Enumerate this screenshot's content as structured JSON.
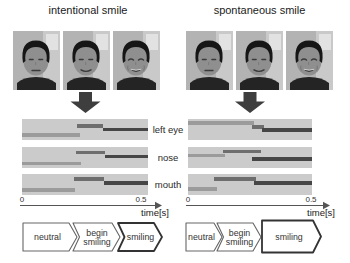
{
  "figure": {
    "feature_labels": [
      "left eye",
      "nose",
      "mouth"
    ],
    "colors": {
      "panel_bg": "#cbcbcb",
      "neutral_bar": "#9b9b9b",
      "begin_bar": "#6e6e6e",
      "smiling_bar": "#464646",
      "arrow": "#3e3e3e",
      "shape_stroke": "#666666",
      "shape_stroke_bold": "#333333",
      "axis": "#555555"
    },
    "groups": [
      {
        "id": "intentional",
        "title": "intentional smile",
        "photos": [
          {
            "expression": "neutral"
          },
          {
            "expression": "slight smile"
          },
          {
            "expression": "big smile"
          }
        ],
        "timeline_rows": [
          {
            "feature": "left eye",
            "bars": [
              {
                "state": "neutral",
                "start_s": 0,
                "end_s": 0.23,
                "top": 14
              },
              {
                "state": "begin smiling",
                "start_s": 0.22,
                "end_s": 0.32,
                "top": 5
              },
              {
                "state": "smiling",
                "start_s": 0.32,
                "end_s": 0.5,
                "top": 8.5
              }
            ]
          },
          {
            "feature": "nose",
            "bars": [
              {
                "state": "neutral",
                "start_s": 0,
                "end_s": 0.235,
                "top": 15
              },
              {
                "state": "begin smiling",
                "start_s": 0.215,
                "end_s": 0.33,
                "top": 4
              },
              {
                "state": "smiling",
                "start_s": 0.33,
                "end_s": 0.5,
                "top": 8
              }
            ]
          },
          {
            "feature": "mouth",
            "bars": [
              {
                "state": "neutral",
                "start_s": 0,
                "end_s": 0.21,
                "top": 14
              },
              {
                "state": "begin smiling",
                "start_s": 0.205,
                "end_s": 0.325,
                "top": 3
              },
              {
                "state": "smiling",
                "start_s": 0.325,
                "end_s": 0.5,
                "top": 7
              }
            ]
          }
        ],
        "axis": {
          "start": "0",
          "end": "0.5",
          "unit": "time[s]"
        },
        "states": [
          {
            "label": "neutral",
            "lines": [
              "neutral"
            ],
            "x": 23,
            "w": 54,
            "notch": false,
            "bold": false,
            "tall": false
          },
          {
            "label": "begin smiling",
            "lines": [
              "begin",
              "smiling"
            ],
            "x": 73,
            "w": 47,
            "notch": true,
            "bold": false,
            "tall": false
          },
          {
            "label": "smiling",
            "lines": [
              "smiling"
            ],
            "x": 118,
            "w": 44,
            "notch": true,
            "bold": true,
            "tall": false
          }
        ]
      },
      {
        "id": "spontaneous",
        "title": "spontaneous smile",
        "photos": [
          {
            "expression": "neutral"
          },
          {
            "expression": "slight smile"
          },
          {
            "expression": "big smile"
          }
        ],
        "timeline_rows": [
          {
            "feature": "left eye",
            "bars": [
              {
                "state": "neutral",
                "start_s": 0,
                "end_s": 0.265,
                "top": 2
              },
              {
                "state": "begin smiling",
                "start_s": 0.26,
                "end_s": 0.305,
                "top": 6
              },
              {
                "state": "smiling",
                "start_s": 0.3,
                "end_s": 0.5,
                "top": 9
              }
            ]
          },
          {
            "feature": "nose",
            "bars": [
              {
                "state": "neutral",
                "start_s": 0,
                "end_s": 0.15,
                "top": 7
              },
              {
                "state": "begin smiling",
                "start_s": 0.14,
                "end_s": 0.295,
                "top": 3
              },
              {
                "state": "smiling",
                "start_s": 0.26,
                "end_s": 0.5,
                "top": 10.5
              }
            ]
          },
          {
            "feature": "mouth",
            "bars": [
              {
                "state": "neutral",
                "start_s": 0,
                "end_s": 0.115,
                "top": 13
              },
              {
                "state": "begin smiling",
                "start_s": 0.105,
                "end_s": 0.275,
                "top": 3
              },
              {
                "state": "smiling",
                "start_s": 0.265,
                "end_s": 0.5,
                "top": 7
              }
            ]
          }
        ],
        "axis": {
          "start": "0",
          "end": "0.5",
          "unit": "time[s]"
        },
        "states": [
          {
            "label": "neutral",
            "lines": [
              "neutral"
            ],
            "x": 186,
            "w": 36,
            "notch": false,
            "bold": false,
            "tall": false
          },
          {
            "label": "begin smiling",
            "lines": [
              "begin",
              "smiling"
            ],
            "x": 217,
            "w": 44,
            "notch": true,
            "bold": false,
            "tall": false
          },
          {
            "label": "smiling",
            "lines": [
              "smiling"
            ],
            "x": 262,
            "w": 59,
            "notch": false,
            "bold": true,
            "tall": true
          }
        ]
      }
    ]
  }
}
